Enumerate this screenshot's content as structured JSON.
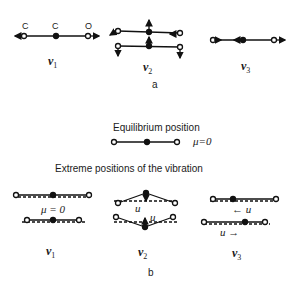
{
  "part_a": {
    "atom_labels": [
      "C",
      "C",
      "O"
    ],
    "modes": [
      {
        "symbol": "v",
        "subscript": "1"
      },
      {
        "symbol": "v",
        "subscript": "2"
      },
      {
        "symbol": "v",
        "subscript": "3"
      }
    ],
    "caption": "a"
  },
  "part_b": {
    "equilibrium_title": "Equilibrium position",
    "equilibrium_mu": "μ=0",
    "extreme_title": "Extreme  positions of the vibration",
    "v1_mu": "μ = 0",
    "v2_mu_top": "u",
    "v2_mu_bottom": "u",
    "v3_label_top": "← u",
    "v3_label_bottom": "u →",
    "modes": [
      {
        "symbol": "v",
        "subscript": "1"
      },
      {
        "symbol": "v",
        "subscript": "2"
      },
      {
        "symbol": "v",
        "subscript": "3"
      }
    ],
    "caption": "b"
  }
}
